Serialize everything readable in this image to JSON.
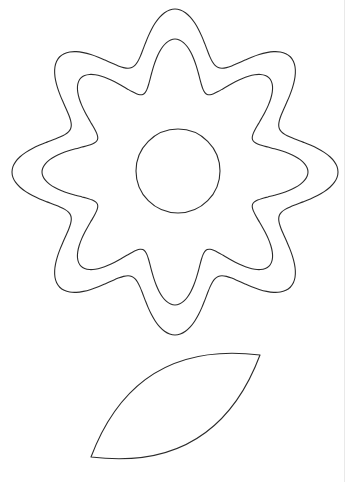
{
  "document": {
    "title": "Flower Coloring Page",
    "kind": "line-art-coloring-page",
    "subject": "flower with stem leaf",
    "caption": ""
  },
  "canvas": {
    "width": 348,
    "height": 482,
    "background_color": "#ffffff",
    "stroke_color": "#2b2b2b",
    "stroke_width": 1.1,
    "fill": "none"
  },
  "edge_rule": {
    "color": "#e9e9e9",
    "x": 344,
    "visible": true
  },
  "shapes": {
    "flower_outer": {
      "name": "outer-scalloped-petal-ring",
      "type": "rosette",
      "center_x": 175,
      "center_y": 172,
      "lobes": 8,
      "radius_max": 163,
      "radius_min": 113,
      "phase_deg": 90,
      "bounds": {
        "left": 14,
        "top": 14,
        "right": 336,
        "bottom": 330
      }
    },
    "flower_inner": {
      "name": "inner-scalloped-petal-ring",
      "type": "rosette",
      "center_x": 175,
      "center_y": 172,
      "lobes": 8,
      "radius_max": 133,
      "radius_min": 84,
      "phase_deg": 90,
      "bounds": {
        "left": 44,
        "top": 42,
        "right": 306,
        "bottom": 302
      }
    },
    "flower_center": {
      "name": "flower-center-circle",
      "type": "circle",
      "center_x": 178,
      "center_y": 171,
      "radius": 42
    },
    "leaf": {
      "name": "leaf-shape",
      "type": "lens",
      "tip_a_x": 91,
      "tip_a_y": 457,
      "tip_b_x": 260,
      "tip_b_y": 355,
      "bulge": 58,
      "angle_deg": -31
    }
  },
  "palette": {
    "ink": "#2b2b2b",
    "paper": "#ffffff",
    "rule": "#e9e9e9"
  }
}
